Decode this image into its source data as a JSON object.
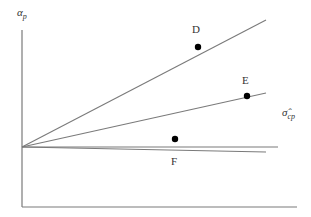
{
  "diagram": {
    "y_axis_label": {
      "main": "α",
      "sub": "p"
    },
    "x_axis_label": {
      "main": "σ̂",
      "sub": "cp"
    },
    "rays": [
      {
        "name": "ray-d",
        "point_label": "D"
      },
      {
        "name": "ray-e",
        "point_label": "E"
      },
      {
        "name": "ray-reference",
        "point_label": ""
      },
      {
        "name": "ray-f",
        "point_label": "F"
      }
    ],
    "colors": {
      "line": "#7a7a7a",
      "point": "#000000",
      "text": "#333333"
    }
  }
}
